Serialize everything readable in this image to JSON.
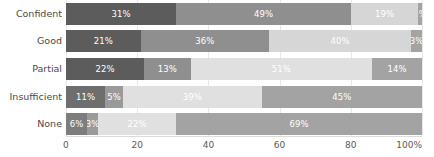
{
  "chart_data": {
    "type": "bar",
    "orientation": "horizontal",
    "stacked": true,
    "normalized_percent": true,
    "title": "",
    "subtitle": "",
    "xlabel": "",
    "ylabel": "",
    "xlim": [
      0,
      100
    ],
    "grid": true,
    "legend_position": "none",
    "categories": [
      "Confident",
      "Good",
      "Partial",
      "Insufficient",
      "None"
    ],
    "xticks": [
      0,
      20,
      40,
      60,
      80,
      100
    ],
    "xticklabels": [
      "0",
      "20",
      "40",
      "60",
      "80",
      "100%"
    ],
    "series": [
      {
        "name": "series-1",
        "color": "#5c5c5c",
        "values": [
          31,
          21,
          22,
          11,
          6
        ]
      },
      {
        "name": "series-2",
        "color": "#8f8f8f",
        "values": [
          49,
          36,
          13,
          5,
          3
        ]
      },
      {
        "name": "series-3",
        "color": "#d6d6d6",
        "values": [
          19,
          40,
          51,
          39,
          22
        ]
      },
      {
        "name": "series-4",
        "color": "#a3a3a3",
        "values": [
          1,
          3,
          14,
          45,
          69
        ]
      }
    ],
    "rows": [
      {
        "category": "Confident",
        "segments": [
          {
            "label": "31%",
            "value": 31,
            "color": "#5c5c5c"
          },
          {
            "label": "49%",
            "value": 49,
            "color": "#8f8f8f"
          },
          {
            "label": "19%",
            "value": 19,
            "color": "#d6d6d6"
          },
          {
            "label": "1%",
            "value": 1,
            "color": "#a3a3a3"
          }
        ]
      },
      {
        "category": "Good",
        "segments": [
          {
            "label": "21%",
            "value": 21,
            "color": "#5c5c5c"
          },
          {
            "label": "36%",
            "value": 36,
            "color": "#8f8f8f"
          },
          {
            "label": "40%",
            "value": 40,
            "color": "#d6d6d6"
          },
          {
            "label": "3%",
            "value": 3,
            "color": "#a3a3a3"
          }
        ]
      },
      {
        "category": "Partial",
        "segments": [
          {
            "label": "22%",
            "value": 22,
            "color": "#5c5c5c"
          },
          {
            "label": "13%",
            "value": 13,
            "color": "#8f8f8f"
          },
          {
            "label": "51%",
            "value": 51,
            "color": "#e0e0e0"
          },
          {
            "label": "14%",
            "value": 14,
            "color": "#a3a3a3"
          }
        ]
      },
      {
        "category": "Insufficient",
        "segments": [
          {
            "label": "11%",
            "value": 11,
            "color": "#6e6e6e"
          },
          {
            "label": "5%",
            "value": 5,
            "color": "#9a9a9a"
          },
          {
            "label": "39%",
            "value": 39,
            "color": "#e0e0e0"
          },
          {
            "label": "45%",
            "value": 45,
            "color": "#a3a3a3"
          }
        ]
      },
      {
        "category": "None",
        "segments": [
          {
            "label": "6%",
            "value": 6,
            "color": "#7d7d7d"
          },
          {
            "label": "3%",
            "value": 3,
            "color": "#9a9a9a"
          },
          {
            "label": "22%",
            "value": 22,
            "color": "#e0e0e0"
          },
          {
            "label": "69%",
            "value": 69,
            "color": "#a3a3a3"
          }
        ]
      }
    ]
  },
  "colors": {
    "grid": "#e8e8e8",
    "axis_line": "#dcdcdc",
    "tick_text": "#5a5a5a",
    "category_text": "#4a4a4a",
    "bar_label_text": "#ffffff",
    "background": "#ffffff"
  }
}
